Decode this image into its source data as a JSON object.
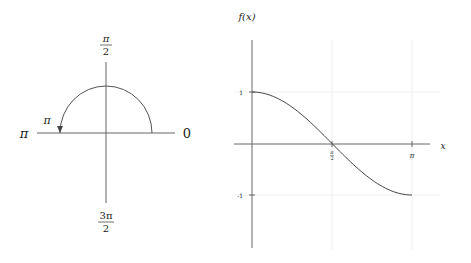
{
  "left_diagram": {
    "labels": {
      "top": {
        "num": "π",
        "den": "2"
      },
      "left": "π",
      "right": "0",
      "bottom": {
        "num": "3π",
        "den": "2"
      },
      "arc_label": "π"
    },
    "arc": {
      "from_angle": "0",
      "to_angle": "π",
      "direction": "counterclockwise"
    }
  },
  "chart_data": {
    "type": "line",
    "title": "",
    "xlabel": "x",
    "ylabel": "f(x)",
    "function": "cos(x)",
    "x_ticks": [
      {
        "value": 1.5708,
        "label": "π/2"
      },
      {
        "value": 3.1416,
        "label": "π"
      }
    ],
    "y_ticks": [
      {
        "value": 1,
        "label": "1"
      },
      {
        "value": -1,
        "label": "-1"
      }
    ],
    "xlim": [
      0,
      3.1416
    ],
    "ylim": [
      -2,
      2
    ],
    "grid": true,
    "series": [
      {
        "name": "f(x)",
        "x": [
          0,
          0.3927,
          0.7854,
          1.1781,
          1.5708,
          1.9635,
          2.3562,
          2.7489,
          3.1416
        ],
        "values": [
          1,
          0.924,
          0.707,
          0.383,
          0,
          -0.383,
          -0.707,
          -0.924,
          -1
        ]
      }
    ]
  },
  "colors": {
    "axis": "#555555",
    "curve": "#444444",
    "grid": "#eeeeee",
    "text": "#222222"
  }
}
